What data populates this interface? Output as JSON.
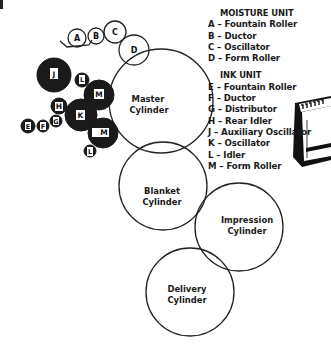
{
  "legend": {
    "moisture_unit": {
      "title": "MOISTURE UNIT",
      "items": [
        {
          "key": "A",
          "label": "A – Fountain Roller"
        },
        {
          "key": "B",
          "label": "B – Ductor"
        },
        {
          "key": "C",
          "label": "C – Oscillator"
        },
        {
          "key": "D",
          "label": "D – Form Roller"
        }
      ]
    },
    "ink_unit": {
      "title": "INK UNIT",
      "items": [
        {
          "key": "E",
          "label": "E – Fountain Roller"
        },
        {
          "key": "F",
          "label": "F – Ductor"
        },
        {
          "key": "G",
          "label": "G – Distributor"
        },
        {
          "key": "H",
          "label": "H – Rear Idler"
        },
        {
          "key": "J",
          "label": "J – Auxiliary Oscillator"
        },
        {
          "key": "K",
          "label": "K – Oscillator"
        },
        {
          "key": "L",
          "label": "L – Idler"
        },
        {
          "key": "M",
          "label": "M – Form Roller"
        }
      ]
    }
  },
  "cylinders": {
    "master": {
      "line1": "Master",
      "line2": "Cylinder"
    },
    "blanket": {
      "line1": "Blanket",
      "line2": "Cylinder"
    },
    "impression": {
      "line1": "Impression",
      "line2": "Cylinder"
    },
    "delivery": {
      "line1": "Delivery",
      "line2": "Cylinder"
    }
  },
  "rollers": {
    "moisture": [
      {
        "label": "A"
      },
      {
        "label": "B"
      },
      {
        "label": "C"
      },
      {
        "label": "D"
      }
    ],
    "ink": [
      {
        "label": "J"
      },
      {
        "label": "L"
      },
      {
        "label": "M"
      },
      {
        "label": "H"
      },
      {
        "label": "K"
      },
      {
        "label": "G"
      },
      {
        "label": "F"
      },
      {
        "label": "E"
      },
      {
        "label": "M"
      },
      {
        "label": "L"
      }
    ]
  },
  "colors": {
    "ink_roller": "#1a1a1a",
    "outline": "#222222",
    "background": "#ffffff"
  }
}
